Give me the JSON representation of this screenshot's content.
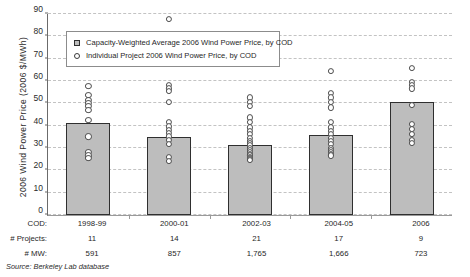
{
  "chart_data": {
    "type": "bar",
    "title": "",
    "xlabel": "",
    "ylabel": "2006 Wind Power Price (2006 $/MWh)",
    "ylim": [
      0,
      90
    ],
    "yticks": [
      0,
      10,
      20,
      30,
      40,
      50,
      60,
      70,
      80,
      90
    ],
    "grid": true,
    "legend_position": "upper-left-inside",
    "categories": [
      "1998-99",
      "2000-01",
      "2002-03",
      "2004-05",
      "2006"
    ],
    "values": [
      41,
      35,
      31.5,
      36,
      50.5
    ],
    "series": [
      {
        "name": "Capacity-Weighted Average 2006 Wind Power Price, by COD",
        "type": "bar",
        "values": [
          41,
          35,
          31.5,
          36,
          50.5
        ]
      },
      {
        "name": "Individual Project 2006 Wind Power Price, by COD",
        "type": "scatter",
        "points": [
          [
            59,
            55,
            53,
            51.5,
            50,
            48.5,
            44,
            36.5,
            29.5,
            28,
            27
          ],
          [
            89,
            59.5,
            58,
            57,
            52,
            43,
            41,
            39.5,
            38,
            36.5,
            35,
            33,
            27.5,
            25.5
          ],
          [
            54,
            52,
            50,
            45,
            43,
            40.5,
            39,
            37.5,
            36,
            34.5,
            33.5,
            32.5,
            31.5,
            30.5,
            29.5,
            28.5,
            28,
            27.5,
            27,
            26.5,
            26
          ],
          [
            66,
            56,
            54,
            52,
            49.5,
            43,
            40.5,
            39,
            37.5,
            36,
            34.5,
            33,
            31.5,
            30.5,
            29.5,
            28.5,
            28
          ],
          [
            67,
            61,
            59.5,
            58,
            50.5,
            42,
            40,
            37.5,
            35,
            33.5
          ]
        ]
      }
    ],
    "annotations": {
      "row_labels": [
        "COD:",
        "# Projects:",
        "# MW:"
      ],
      "cod": [
        "1998-99",
        "2000-01",
        "2002-03",
        "2004-05",
        "2006"
      ],
      "projects": [
        "11",
        "14",
        "21",
        "17",
        "9"
      ],
      "mw": [
        "591",
        "857",
        "1,765",
        "1,666",
        "723"
      ]
    },
    "source_note": "Source: Berkeley Lab database",
    "colors": {
      "bar_fill": "#bdbdbd",
      "bar_border": "#2f2f2f",
      "dot_border": "#4a4a4a",
      "gridline": "#c3c3c3",
      "axis": "#6b6b6b",
      "text": "#1f1f1f"
    }
  }
}
